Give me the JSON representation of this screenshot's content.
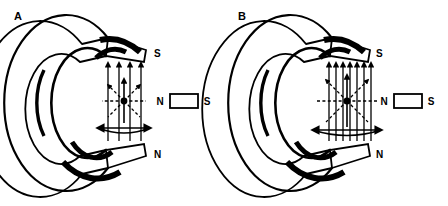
{
  "figure": {
    "background_color": "#ffffff",
    "stroke_color": "#000000",
    "width": 448,
    "height": 206
  },
  "panels": [
    {
      "label": "A",
      "label_x": 14,
      "label_y": 20,
      "origin_x": 0,
      "ring": {
        "center_x": 78,
        "center_y": 103,
        "outer_rx": 62,
        "outer_ry": 88,
        "inner_rx": 36,
        "inner_ry": 55,
        "depth_dx": -26,
        "depth_dy": 6,
        "gap_top_angle": -34,
        "gap_bottom_angle": 34
      },
      "poles": {
        "top": {
          "label": "S",
          "x": 154,
          "y": 57
        },
        "bottom": {
          "label": "N",
          "x": 154,
          "y": 158
        }
      },
      "gap": {
        "x_left": 104,
        "x_right": 146,
        "y_top": 62,
        "y_bottom": 140,
        "field_line_count": 4,
        "field_direction": "up",
        "strength": "weaker"
      },
      "burst": {
        "center_x": 124,
        "center_y": 101,
        "ray_count": 8,
        "radius": 22,
        "style": "dashed",
        "arc_half_width": 26
      },
      "bar_magnet": {
        "x": 170,
        "y": 94,
        "width": 28,
        "height": 14,
        "left_label": "N",
        "right_label": "S",
        "fill": "#ffffff",
        "stroke": "#000000"
      }
    },
    {
      "label": "B",
      "label_x": 238,
      "label_y": 20,
      "origin_x": 224,
      "ring": {
        "center_x": 300,
        "center_y": 103,
        "outer_rx": 62,
        "outer_ry": 88,
        "inner_rx": 36,
        "inner_ry": 55,
        "depth_dx": -26,
        "depth_dy": 6,
        "gap_top_angle": -34,
        "gap_bottom_angle": 34
      },
      "poles": {
        "top": {
          "label": "S",
          "x": 376,
          "y": 57
        },
        "bottom": {
          "label": "N",
          "x": 376,
          "y": 158
        }
      },
      "gap": {
        "x_left": 324,
        "x_right": 370,
        "y_top": 62,
        "y_bottom": 140,
        "field_line_count": 7,
        "field_direction": "up",
        "strength": "stronger"
      },
      "burst": {
        "center_x": 347,
        "center_y": 101,
        "ray_count": 8,
        "radius": 30,
        "style": "dashed",
        "arc_half_width": 34
      },
      "bar_magnet": {
        "x": 394,
        "y": 94,
        "width": 28,
        "height": 14,
        "left_label": "N",
        "right_label": "S",
        "fill": "#ffffff",
        "stroke": "#000000"
      }
    }
  ]
}
